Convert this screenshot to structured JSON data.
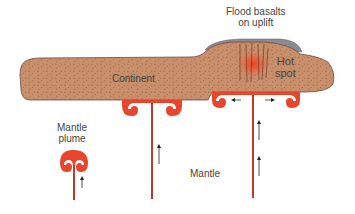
{
  "labels": {
    "flood_basalts_line1": "Flood basalts",
    "flood_basalts_line2": "on uplift",
    "hot_spot_line1": "Hot",
    "hot_spot_line2": "spot",
    "continent": "Continent",
    "mantle_plume_line1": "Mantle",
    "mantle_plume_line2": "plume",
    "mantle": "Mantle"
  },
  "colors": {
    "continent_fill": "#c98f6a",
    "continent_speckle": "#8a5a3e",
    "continent_outline": "#6e4a4a",
    "basalt_cap": "#8c8a92",
    "plume_red": "#e8452c",
    "plume_stem": "#c23a2a",
    "hotspot_glow": "#f03a1c",
    "arrow": "#222222",
    "spread_arrow": "#2a7a3a",
    "text": "#444444"
  },
  "diagram": {
    "components": [
      "continent",
      "flood basalt cap",
      "hot spot",
      "plume head under hot spot",
      "plume head under continent",
      "young mantle plume"
    ],
    "arrows": {
      "upward_flow": 4,
      "lateral_spreading": 2
    }
  }
}
